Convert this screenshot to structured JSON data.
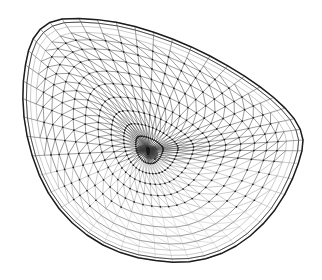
{
  "figure": {
    "type": "wireframe-mesh-diagram",
    "background_color": "#ffffff",
    "line_color": "#3a3a3a",
    "boundary_color": "#1c1c1c",
    "node_color": "#1a1a1a",
    "width": 322,
    "height": 280
  },
  "mesh": {
    "hub": {
      "x": 148,
      "y": 150
    },
    "spokes": 48,
    "rings": 15,
    "quad_band_rings": 3,
    "node_radius": 0.85,
    "triangulated_interior": true,
    "boundary_closed": true,
    "outline": {
      "description": "Teardrop / egg silhouette: rounded apex upper-left, long tapering tip to the right, broad round base at the bottom.",
      "extents": {
        "left": 23,
        "right": 303,
        "top": 18,
        "bottom": 263
      },
      "points": [
        [
          62,
          19
        ],
        [
          44,
          26
        ],
        [
          32,
          41
        ],
        [
          26,
          62
        ],
        [
          23,
          88
        ],
        [
          24,
          117
        ],
        [
          30,
          148
        ],
        [
          41,
          179
        ],
        [
          57,
          206
        ],
        [
          78,
          228
        ],
        [
          103,
          245
        ],
        [
          131,
          256
        ],
        [
          159,
          261
        ],
        [
          186,
          262
        ],
        [
          212,
          257
        ],
        [
          236,
          246
        ],
        [
          258,
          229
        ],
        [
          277,
          207
        ],
        [
          291,
          182
        ],
        [
          300,
          158
        ],
        [
          303,
          140
        ],
        [
          297,
          123
        ],
        [
          283,
          106
        ],
        [
          263,
          89
        ],
        [
          238,
          72
        ],
        [
          210,
          56
        ],
        [
          180,
          42
        ],
        [
          150,
          31
        ],
        [
          120,
          23
        ],
        [
          90,
          19
        ]
      ]
    },
    "rim_offsets": [
      0.0,
      0.045,
      0.095,
      0.155
    ],
    "ring_profile": [
      0.0,
      0.075,
      0.155,
      0.24,
      0.33,
      0.425,
      0.52,
      0.61,
      0.695,
      0.772,
      0.84,
      0.895,
      0.94,
      0.972,
      1.0
    ],
    "perspective": {
      "description": "Bowl viewed obliquely from above; rings compress toward the lower rim producing foreshortening.",
      "foreshorten_bottom": 0.62,
      "hub_bias_x": -0.08,
      "hub_bias_y": -0.07
    },
    "fade": {
      "description": "Edges near the lower rim render lighter due to overlapping far-side geometry.",
      "soft_start_y": 0.74,
      "faint_start_y": 0.58
    }
  }
}
